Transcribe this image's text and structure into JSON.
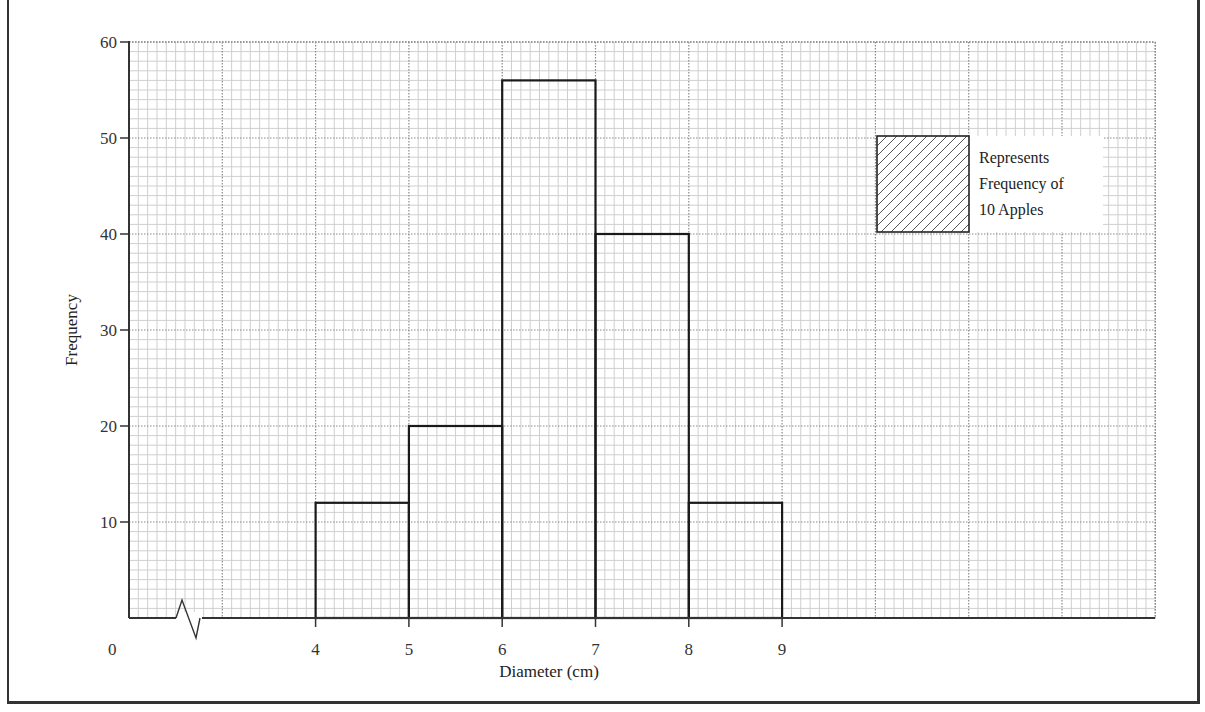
{
  "chart_data": {
    "type": "bar",
    "subtype": "histogram",
    "title": "",
    "xlabel": "Diameter (cm)",
    "ylabel": "Frequency",
    "x_tick_labels": [
      "4",
      "5",
      "6",
      "7",
      "8",
      "9"
    ],
    "y_tick_labels": [
      "10",
      "20",
      "30",
      "40",
      "50",
      "60"
    ],
    "origin_label": "0",
    "axis_break_on_x": true,
    "categories": [
      "4-5",
      "5-6",
      "6-7",
      "7-8",
      "8-9"
    ],
    "bins": [
      {
        "from": 4,
        "to": 5,
        "value": 12
      },
      {
        "from": 5,
        "to": 6,
        "value": 20
      },
      {
        "from": 6,
        "to": 7,
        "value": 56
      },
      {
        "from": 7,
        "to": 8,
        "value": 40
      },
      {
        "from": 8,
        "to": 9,
        "value": 12
      }
    ],
    "values": [
      12,
      20,
      56,
      40,
      12
    ],
    "ylim": [
      0,
      60
    ],
    "xlim_visible": [
      2,
      13
    ],
    "grid": true,
    "legend": {
      "position": "upper-right",
      "swatch": "hatched-square",
      "lines": [
        "Represents",
        "Frequency of",
        "10 Apples"
      ]
    }
  },
  "colors": {
    "bar_outline": "#1a1a1a",
    "grid_major": "#8a8a8a",
    "grid_minor": "#cfcfcf",
    "axis": "#333333",
    "background": "#ffffff"
  }
}
